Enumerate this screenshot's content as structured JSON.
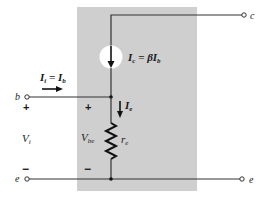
{
  "diagram": {
    "colors": {
      "model_box": "#cfcfcf",
      "wire": "#333333",
      "source_fill": "#ffffff",
      "text": "#1a1a1a"
    },
    "terminals": {
      "base": "b",
      "collector": "c",
      "emitter_left": "e",
      "emitter_right": "e"
    },
    "labels": {
      "input_current": {
        "main": "I",
        "sub_i": "i",
        "eq": " = ",
        "main2": "I",
        "sub_b": "b"
      },
      "collector_current": {
        "main": "I",
        "sub_c": "c",
        "eq": " = βI",
        "sub_b": "b"
      },
      "emitter_current": {
        "main": "I",
        "sub_e": "e"
      },
      "input_voltage": {
        "main": "V",
        "sub": "i"
      },
      "base_emitter_voltage": {
        "main": "V",
        "sub": "be"
      },
      "resistor": {
        "main": "r",
        "sub": "e"
      },
      "plus": "+",
      "minus": "−"
    }
  }
}
